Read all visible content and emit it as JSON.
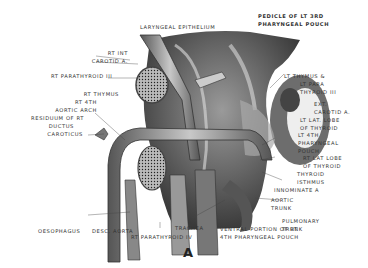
{
  "figure": {
    "letter": "A",
    "labels": {
      "laryngeal_epithelium": "LARYNGEAL EPITHELIUM",
      "pedicle_1": "PEDICLE OF LT 3RD",
      "pedicle_2": "PHARYNGEAL POUCH",
      "rt_int_1": "RT INT",
      "rt_int_2": "CAROTID A.",
      "rt_parathyroid_iii": "RT PARATHYROID III",
      "rt_thymus": "RT THYMUS",
      "rt_4th_1": "RT 4TH",
      "rt_4th_2": "AORTIC ARCH",
      "residuum_1": "RESIDUUM OF RT",
      "residuum_2": "DUCTUS",
      "residuum_3": "CAROTICUS",
      "lt_thymus_1": "LT THYMUS &",
      "lt_thymus_2": "LT PARA",
      "lt_thymus_3": "THYROID III",
      "ext_carotid_1": "EXT.",
      "ext_carotid_2": "CAROTID A.",
      "lt_lat_lobe_1": "LT LAT. LOBE",
      "lt_lat_lobe_2": "OF THYROID",
      "lt_4th_1": "LT 4TH",
      "lt_4th_2": "PHARYNGEAL",
      "lt_4th_3": "POUCH",
      "rt_lat_lobe_1": "RT LAT LOBE",
      "rt_lat_lobe_2": "OF THYROID",
      "thyroid_isthmus_1": "THYROID",
      "thyroid_isthmus_2": "ISTHMUS",
      "innominate": "INNOMINATE A",
      "aortic_trunk_1": "AORTIC",
      "aortic_trunk_2": "TRUNK",
      "pulmonary_1": "PULMONARY",
      "pulmonary_2": "TRUNK",
      "ventral_1": "VENTRAL PORTION OF RT",
      "ventral_2": "4TH PHARYNGEAL POUCH",
      "oesophagus": "OESOPHAGUS",
      "desc_aorta": "DESC. AORTA",
      "trachea": "TRACHEA",
      "rt_parathyroid_iv": "RT PARATHYROID IV"
    }
  }
}
